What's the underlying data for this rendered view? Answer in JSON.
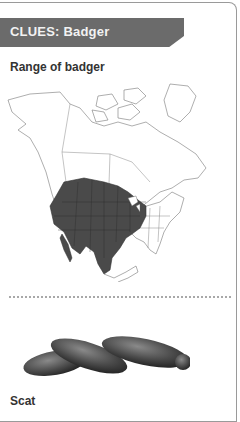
{
  "header": {
    "title": "CLUES: Badger"
  },
  "sections": [
    {
      "label": "Range of badger",
      "image": "north-america-range-map"
    },
    {
      "label": "Scat",
      "image": "badger-scat-illustration"
    }
  ],
  "colors": {
    "header_bg": "#6b6b6b",
    "range_fill": "#4a4a4a",
    "border": "#9a9a9a"
  }
}
